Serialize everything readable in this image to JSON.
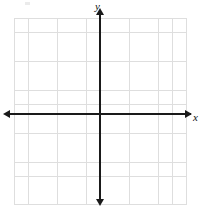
{
  "figure": {
    "kind": "coordinate-plane",
    "width": 204,
    "height": 213,
    "background_color": "#ffffff"
  },
  "axes": {
    "x": {
      "label": "x",
      "label_style": "italic-serif",
      "orientation": "horizontal",
      "arrowheads": [
        "left",
        "right"
      ],
      "color": "#1a1a1a"
    },
    "y": {
      "label": "y",
      "label_style": "italic-serif",
      "orientation": "vertical",
      "arrowheads": [
        "top",
        "bottom"
      ],
      "color": "#1a1a1a"
    }
  },
  "grid": {
    "visible": true,
    "color": "#d9d9d9",
    "cell_size_px": 14.4,
    "columns": 12,
    "rows": 13,
    "tick_labels": [],
    "numbers_shown": false
  },
  "origin": {
    "x_px": 100,
    "y_px": 114,
    "labeled": false
  },
  "chart_data": {
    "type": "scatter",
    "title": "",
    "subtitle": "",
    "xlabel": "x",
    "ylabel": "y",
    "series": [],
    "annotations": [],
    "legend": null,
    "legend_position": "none",
    "grid": true,
    "xlim": [
      -6,
      6
    ],
    "ylim": [
      -6.5,
      6.5
    ],
    "xticks": [],
    "yticks": []
  }
}
